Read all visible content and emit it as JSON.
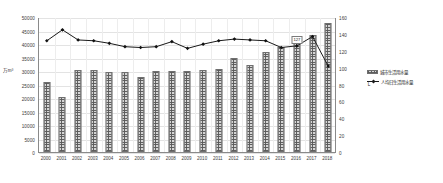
{
  "chart_data": {
    "type": "bar",
    "title": "",
    "subtitle": "",
    "xlabel": "",
    "ylabel_left": "万m³",
    "ylabel_right": "L",
    "categories": [
      "2000",
      "2001",
      "2002",
      "2003",
      "2004",
      "2005",
      "2006",
      "2007",
      "2008",
      "2009",
      "2010",
      "2011",
      "2012",
      "2013",
      "2014",
      "2015",
      "2016",
      "2017",
      "2018"
    ],
    "ylim_left": [
      0,
      50000
    ],
    "ylim_right": [
      0,
      160
    ],
    "yticks_left": [
      "0",
      "5000",
      "10000",
      "15000",
      "20000",
      "25000",
      "30000",
      "35000",
      "40000",
      "45000",
      "50000"
    ],
    "yticks_right": [
      "0",
      "20",
      "40",
      "60",
      "80",
      "100",
      "120",
      "140",
      "160"
    ],
    "grid": true,
    "legend_position": "right",
    "series": [
      {
        "name": "城市生活用水量",
        "type": "bar",
        "axis": "left",
        "unit": "万m³",
        "values": [
          26000,
          20500,
          30200,
          30200,
          29600,
          29600,
          27700,
          30000,
          30100,
          30000,
          30200,
          30600,
          34700,
          32400,
          37200,
          39000,
          40200,
          43500,
          47900
        ]
      },
      {
        "name": "人均日生活用水量",
        "type": "line",
        "axis": "right",
        "unit": "L",
        "values": [
          133,
          146,
          134,
          133,
          130,
          126,
          125,
          126,
          132,
          124,
          129,
          133,
          135,
          134,
          133,
          125,
          127,
          138,
          103
        ]
      }
    ],
    "annotations": [
      {
        "text": "127",
        "category": "2016",
        "value": 127
      }
    ]
  },
  "legend": {
    "items": [
      {
        "label": "城市生活用水量",
        "marker": "hatched-bar-swatch"
      },
      {
        "label": "人均日生活用水量",
        "marker": "line-diamond-swatch"
      }
    ]
  }
}
